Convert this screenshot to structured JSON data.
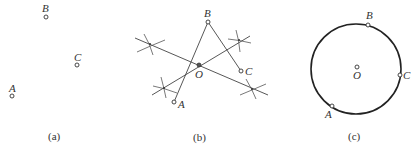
{
  "panels": [
    {
      "caption": "(a)",
      "points": [
        {
          "name": "A",
          "label": "A"
        },
        {
          "name": "B",
          "label": "B"
        },
        {
          "name": "C",
          "label": "C"
        }
      ]
    },
    {
      "caption": "(b)",
      "points": [
        {
          "name": "A",
          "label": "A"
        },
        {
          "name": "B",
          "label": "B"
        },
        {
          "name": "C",
          "label": "C"
        },
        {
          "name": "O",
          "label": "O"
        }
      ],
      "description": "Perpendicular bisectors of AB and BC intersect at O"
    },
    {
      "caption": "(c)",
      "points": [
        {
          "name": "A",
          "label": "A"
        },
        {
          "name": "B",
          "label": "B"
        },
        {
          "name": "C",
          "label": "C"
        },
        {
          "name": "O",
          "label": "O"
        }
      ],
      "description": "Circle centered at O passing through A, B, C"
    }
  ],
  "colors": {
    "stroke": "#333333",
    "background": "#ffffff"
  }
}
